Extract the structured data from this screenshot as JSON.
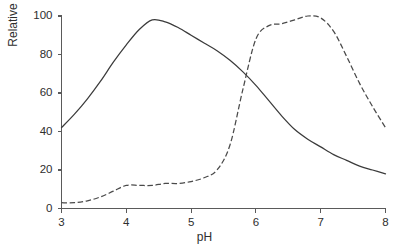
{
  "chart_data": {
    "type": "line",
    "title": "",
    "subtitle": "",
    "xlabel": "pH",
    "ylabel": "Relative activity",
    "xlim": [
      3,
      8
    ],
    "ylim": [
      0,
      100
    ],
    "xticks": [
      "3",
      "4",
      "5",
      "6",
      "7",
      "8"
    ],
    "yticks": [
      "0",
      "20",
      "40",
      "60",
      "80",
      "100"
    ],
    "grid": false,
    "legend": "none",
    "annotations": [],
    "series": [
      {
        "name": "solid curve",
        "style": "solid",
        "color": "#3b3b3b",
        "x": [
          3.0,
          3.2,
          3.4,
          3.6,
          3.8,
          4.0,
          4.2,
          4.4,
          4.6,
          4.8,
          5.0,
          5.2,
          5.4,
          5.6,
          5.8,
          6.0,
          6.2,
          6.4,
          6.6,
          6.8,
          7.0,
          7.2,
          7.4,
          7.6,
          7.8,
          8.0
        ],
        "values": [
          42,
          49,
          57,
          66,
          76,
          85,
          93,
          98,
          97,
          94,
          90,
          86,
          82,
          77,
          71,
          64,
          56,
          48,
          41,
          36,
          32,
          28,
          25,
          22,
          20,
          18
        ]
      },
      {
        "name": "dashed curve",
        "style": "dashed",
        "color": "#4a4a4a",
        "x": [
          3.0,
          3.2,
          3.4,
          3.6,
          3.8,
          4.0,
          4.2,
          4.4,
          4.6,
          4.8,
          5.0,
          5.2,
          5.4,
          5.6,
          5.8,
          6.0,
          6.2,
          6.4,
          6.6,
          6.8,
          7.0,
          7.2,
          7.4,
          7.6,
          7.8,
          8.0
        ],
        "values": [
          3,
          3,
          4,
          6,
          9,
          12,
          12,
          12,
          13,
          13,
          14,
          16,
          20,
          33,
          62,
          88,
          95,
          96,
          98,
          100,
          99,
          92,
          79,
          65,
          53,
          42
        ]
      }
    ]
  },
  "axes": {
    "x_tick_values": [
      3,
      4,
      5,
      6,
      7,
      8
    ],
    "y_tick_values": [
      0,
      20,
      40,
      60,
      80,
      100
    ]
  }
}
